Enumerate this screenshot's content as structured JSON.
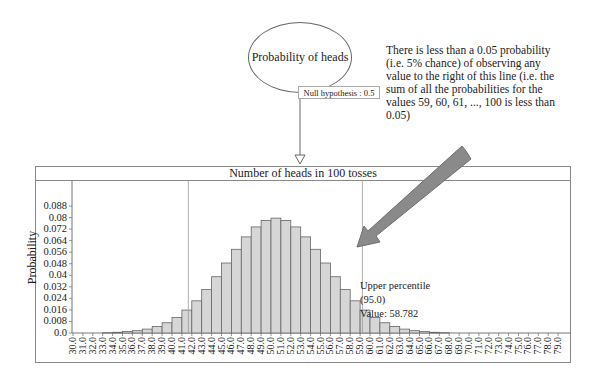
{
  "diagram": {
    "node_label": "Probability of heads",
    "node_param": "Null hypothesis : 0.5",
    "annotation": "There is less than a 0.05 probability (i.e. 5% chance) of observing any value to the right of this line (i.e. the sum of all the probabilities for the values 59, 60, 61, ..., 100 is less than 0.05)",
    "upper_percentile_label": "Upper percentile (95.0)",
    "upper_percentile_value": "Value: 58.782"
  },
  "chart_data": {
    "type": "bar",
    "title": "Number of heads in 100 tosses",
    "xlabel": "",
    "ylabel": "Probability",
    "ylim": [
      0,
      0.088
    ],
    "yticks": [
      "0.0",
      "0.008",
      "0.016",
      "0.024",
      "0.032",
      "0.04",
      "0.048",
      "0.056",
      "0.064",
      "0.072",
      "0.08",
      "0.088"
    ],
    "categories": [
      "30.0",
      "31.0",
      "32.0",
      "33.0",
      "34.0",
      "35.0",
      "36.0",
      "37.0",
      "38.0",
      "39.0",
      "40.0",
      "41.0",
      "42.0",
      "43.0",
      "44.0",
      "45.0",
      "46.0",
      "47.0",
      "48.0",
      "49.0",
      "50.0",
      "51.0",
      "52.0",
      "53.0",
      "54.0",
      "55.0",
      "56.0",
      "57.0",
      "58.0",
      "59.0",
      "60.0",
      "61.0",
      "62.0",
      "63.0",
      "64.0",
      "65.0",
      "66.0",
      "67.0",
      "68.0",
      "69.0",
      "70.0",
      "71.0",
      "72.0",
      "73.0",
      "74.0",
      "75.0",
      "76.0",
      "77.0",
      "78.0",
      "79.0"
    ],
    "values": [
      2e-05,
      4e-05,
      0.00011,
      0.00023,
      0.0005,
      0.001,
      0.0016,
      0.0027,
      0.0045,
      0.0071,
      0.0108,
      0.0159,
      0.0223,
      0.0301,
      0.039,
      0.0485,
      0.058,
      0.0666,
      0.0735,
      0.078,
      0.0796,
      0.078,
      0.0735,
      0.0666,
      0.058,
      0.0485,
      0.039,
      0.0301,
      0.0223,
      0.0159,
      0.0108,
      0.0071,
      0.0045,
      0.0027,
      0.0016,
      0.001,
      0.0005,
      0.00023,
      0.00011,
      4e-05,
      2e-05,
      0,
      0,
      0,
      0,
      0,
      0,
      0,
      0,
      0
    ],
    "reference_lines": [
      {
        "label": "Lower percentile",
        "x": 41.2
      },
      {
        "label": "Upper percentile (95.0)",
        "x": 58.782
      }
    ],
    "grid": false,
    "legend": "none"
  }
}
